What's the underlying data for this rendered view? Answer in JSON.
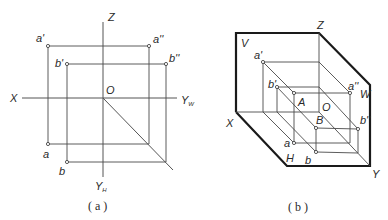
{
  "figure_a": {
    "caption": "( a )",
    "labels": {
      "Z": "Z",
      "X": "X",
      "O": "O",
      "YW": "Y",
      "YW_sub": "W",
      "YH": "Y",
      "YH_sub": "H",
      "a_prime": "a'",
      "a_dprime": "a''",
      "b_prime": "b'",
      "b_dprime": "b''",
      "a": "a",
      "b": "b"
    }
  },
  "figure_b": {
    "caption": "( b )",
    "labels": {
      "V": "V",
      "W": "W",
      "H": "H",
      "X": "X",
      "Y": "Y",
      "Z": "Z",
      "O": "O",
      "A": "A",
      "B": "B",
      "a_prime": "a'",
      "a_dprime": "a''",
      "b_prime": "b'",
      "b_dprime": "b''",
      "a": "a",
      "b": "b"
    }
  },
  "colors": {
    "line": "#4a4a4a",
    "thick_line": "#1a1a1a",
    "background": "#ffffff"
  }
}
